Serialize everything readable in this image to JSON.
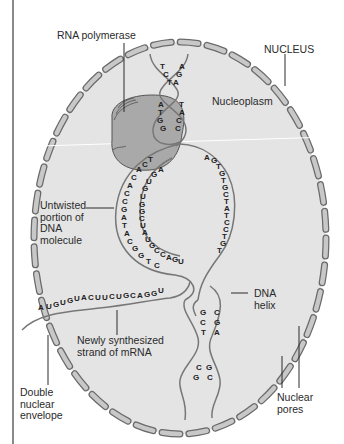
{
  "labels": {
    "rna_polymerase": "RNA polymerase",
    "nucleus": "NUCLEUS",
    "nucleoplasm": "Nucleoplasm",
    "untwisted_dna": [
      "Untwisted",
      "portion of",
      "DNA",
      "molecule"
    ],
    "dna_helix": [
      "DNA",
      "helix"
    ],
    "mrna_strand": [
      "Newly synthesized",
      "strand of mRNA"
    ],
    "nuclear_envelope": [
      "Double",
      "nuclear",
      "envelope"
    ],
    "nuclear_pores": [
      "Nuclear",
      "pores"
    ]
  },
  "sequences": {
    "top_helix_left": [
      "T",
      "C",
      "T"
    ],
    "top_helix_right": [
      "A",
      "G",
      "A"
    ],
    "second_helix_left": [
      "A",
      "T",
      "G",
      "G"
    ],
    "second_helix_right": [
      "T",
      "A",
      "C",
      "C"
    ],
    "template_strand": "TCACACCGATACGGTC",
    "rna_in_bubble": "AGUGUGGCUAUGCCAGU",
    "coding_strand": "AGTGTGCTATCCTGT",
    "mrna": "AUGUGUACUUCUGCAGGU",
    "lower_helix_left": [
      "G",
      "C",
      "T"
    ],
    "lower_helix_right": [
      "C",
      "G",
      "A"
    ],
    "bottom_helix_left": [
      "C",
      "G"
    ],
    "bottom_helix_right": [
      "G",
      "C"
    ]
  },
  "colors": {
    "nucleoplasm": "#e4e4e4",
    "envelope_segment": "#c8c8c8",
    "polymerase": "#a9a9a9",
    "strand": "#777777",
    "text": "#2a2a2a"
  }
}
